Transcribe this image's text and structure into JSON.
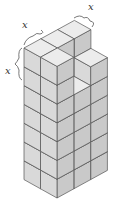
{
  "figure": {
    "labels": [
      {
        "id": "top-left-edge",
        "text": "x",
        "x": 22,
        "y": 24
      },
      {
        "id": "top-right-edge",
        "text": "x",
        "x": 88,
        "y": 6
      },
      {
        "id": "left-vertical-edge",
        "text": "x",
        "x": 5,
        "y": 69
      }
    ],
    "colors": {
      "top_face": "#ececec",
      "left_face": "#d9d9d9",
      "right_face": "#c9c9c9",
      "edge": "#555555"
    }
  }
}
